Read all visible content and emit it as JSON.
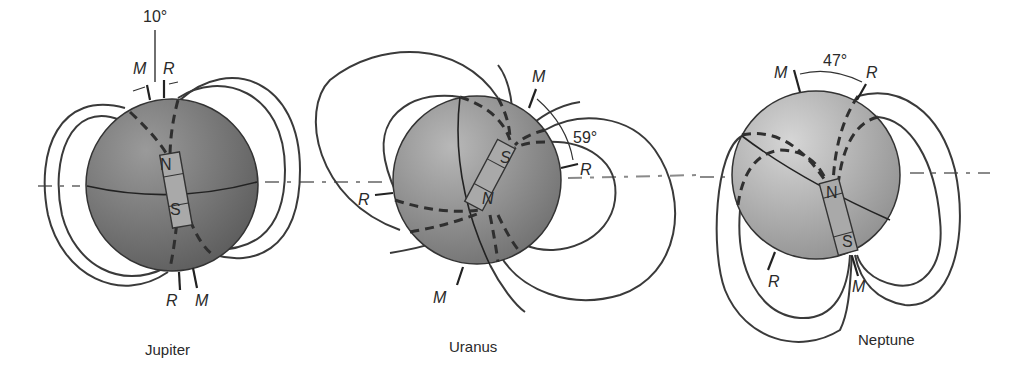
{
  "figure": {
    "panels": [
      {
        "planet": "Jupiter",
        "tilt_label": "10°",
        "magnetic_axis_label": "M",
        "rotation_axis_label": "R",
        "pole_top": "N",
        "pole_bottom": "S",
        "bottom_labels": [
          "R",
          "M"
        ]
      },
      {
        "planet": "Uranus",
        "tilt_label": "59°",
        "magnetic_axis_label": "M",
        "rotation_axis_label": "R",
        "pole_top": "S",
        "pole_bottom": "N",
        "bottom_labels": [
          "M",
          "R"
        ]
      },
      {
        "planet": "Neptune",
        "tilt_label": "47°",
        "magnetic_axis_label": "M",
        "rotation_axis_label": "R",
        "pole_top": "N",
        "pole_bottom": "S",
        "bottom_labels": [
          "R",
          "M"
        ]
      }
    ]
  }
}
